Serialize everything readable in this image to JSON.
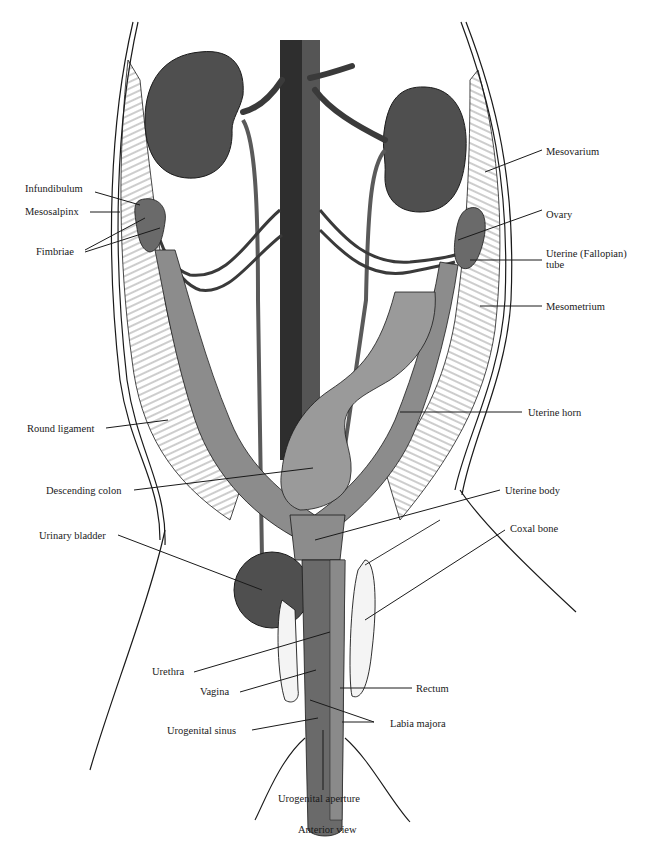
{
  "figure": {
    "view": "Anterior view",
    "colors": {
      "ink": "#1a1a1a",
      "organ_dark": "#4a4a4a",
      "organ_mid": "#7a7a7a",
      "organ_light": "#9a9a9a",
      "mesentery": "#f2f2f2",
      "background": "#ffffff"
    }
  },
  "labels": {
    "infundibulum": "Infundibulum",
    "mesosalpinx": "Mesosalpinx",
    "fimbriae": "Fimbriae",
    "round_ligament": "Round ligament",
    "descending_colon": "Descending colon",
    "urinary_bladder": "Urinary bladder",
    "urethra": "Urethra",
    "vagina": "Vagina",
    "urogenital_sinus": "Urogenital sinus",
    "urogenital_aperture": "Urogenital aperture",
    "mesovarium": "Mesovarium",
    "ovary": "Ovary",
    "uterine_tube_line1": "Uterine (Fallopian)",
    "uterine_tube_line2": "tube",
    "mesometrium": "Mesometrium",
    "uterine_horn": "Uterine horn",
    "uterine_body": "Uterine body",
    "coxal_bone": "Coxal bone",
    "rectum": "Rectum",
    "labia_majora": "Labia majora"
  }
}
